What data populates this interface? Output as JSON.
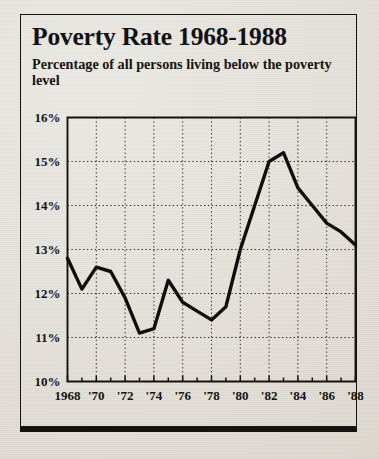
{
  "clipping": {
    "title": "Poverty Rate 1968-1988",
    "subtitle": "Percentage of all persons living below the poverty level"
  },
  "colors": {
    "ink": "#100e0c",
    "paper": "#e6e3dc",
    "grid": "#2a2724",
    "frame": "#15130f"
  },
  "chart_data": {
    "type": "line",
    "title": "Poverty Rate 1968-1988",
    "subtitle": "Percentage of all persons living below the poverty level",
    "xlabel": "",
    "ylabel": "",
    "xlim": [
      1968,
      1988
    ],
    "ylim": [
      10,
      16
    ],
    "grid": true,
    "legend": false,
    "y_ticks": [
      10,
      11,
      12,
      13,
      14,
      15,
      16
    ],
    "y_tick_labels": [
      "10%",
      "11%",
      "12%",
      "13%",
      "14%",
      "15%",
      "16%"
    ],
    "x_ticks": [
      1968,
      1970,
      1972,
      1974,
      1976,
      1978,
      1980,
      1982,
      1984,
      1986,
      1988
    ],
    "x_tick_labels": [
      "1968",
      "'70",
      "'72",
      "'74",
      "'76",
      "'78",
      "'80",
      "'82",
      "'84",
      "'86",
      "'88"
    ],
    "x_minor_ticks": [
      1969,
      1971,
      1973,
      1975,
      1977,
      1979,
      1981,
      1983,
      1985,
      1987
    ],
    "x": [
      1968,
      1969,
      1970,
      1971,
      1972,
      1973,
      1974,
      1975,
      1976,
      1977,
      1978,
      1979,
      1980,
      1981,
      1982,
      1983,
      1984,
      1985,
      1986,
      1987,
      1988
    ],
    "values": [
      12.8,
      12.1,
      12.6,
      12.5,
      11.9,
      11.1,
      11.2,
      12.3,
      11.8,
      11.6,
      11.4,
      11.7,
      13.0,
      14.0,
      15.0,
      15.2,
      14.4,
      14.0,
      13.6,
      13.4,
      13.1
    ],
    "series": [
      {
        "name": "Poverty rate",
        "values": [
          12.8,
          12.1,
          12.6,
          12.5,
          11.9,
          11.1,
          11.2,
          12.3,
          11.8,
          11.6,
          11.4,
          11.7,
          13.0,
          14.0,
          15.0,
          15.2,
          14.4,
          14.0,
          13.6,
          13.4,
          13.1
        ]
      }
    ]
  }
}
